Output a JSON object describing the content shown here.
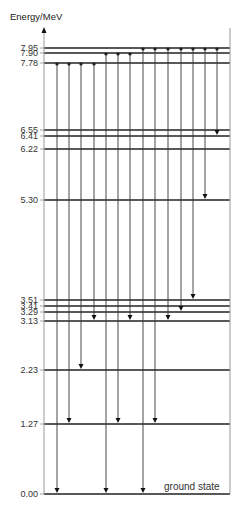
{
  "axis": {
    "label": "Energy/MeV",
    "axis_x": 44,
    "axis_top": 27,
    "right_x": 230,
    "bottom_y": 494
  },
  "levels": [
    {
      "energy": "7.95",
      "y": 48
    },
    {
      "energy": "7.90",
      "y": 53
    },
    {
      "energy": "7.78",
      "y": 63
    },
    {
      "energy": "6.55",
      "y": 130
    },
    {
      "energy": "6.41",
      "y": 136
    },
    {
      "energy": "6.22",
      "y": 149
    },
    {
      "energy": "5.30",
      "y": 200
    },
    {
      "energy": "3.51",
      "y": 300
    },
    {
      "energy": "3.41",
      "y": 306
    },
    {
      "energy": "3.29",
      "y": 312
    },
    {
      "energy": "3.13",
      "y": 321
    },
    {
      "energy": "2.23",
      "y": 370
    },
    {
      "energy": "1.27",
      "y": 424
    },
    {
      "energy": "0.00",
      "y": 494
    }
  ],
  "ground_label": "ground state",
  "transitions": [
    {
      "x": 57,
      "from": "7.78",
      "to": "0.00"
    },
    {
      "x": 69,
      "from": "7.78",
      "to": "1.27"
    },
    {
      "x": 81,
      "from": "7.78",
      "to": "2.23"
    },
    {
      "x": 94,
      "from": "7.78",
      "to": "3.13"
    },
    {
      "x": 106,
      "from": "7.90",
      "to": "0.00"
    },
    {
      "x": 118,
      "from": "7.90",
      "to": "1.27"
    },
    {
      "x": 130,
      "from": "7.90",
      "to": "3.13"
    },
    {
      "x": 143,
      "from": "7.95",
      "to": "0.00"
    },
    {
      "x": 155,
      "from": "7.95",
      "to": "1.27"
    },
    {
      "x": 168,
      "from": "7.95",
      "to": "3.13"
    },
    {
      "x": 181,
      "from": "7.95",
      "to": "3.29"
    },
    {
      "x": 193,
      "from": "7.95",
      "to": "3.51"
    },
    {
      "x": 205,
      "from": "7.95",
      "to": "5.30"
    },
    {
      "x": 217,
      "from": "7.95",
      "to": "6.41"
    }
  ]
}
